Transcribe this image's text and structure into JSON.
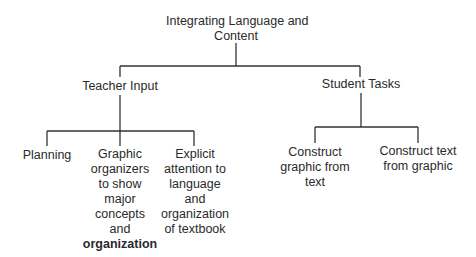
{
  "diagram": {
    "type": "tree",
    "root": {
      "label_lines": [
        "Integrating Language and",
        "Content"
      ]
    },
    "branches": [
      {
        "label": "Teacher Input",
        "children": [
          {
            "label_lines": [
              "Planning"
            ]
          },
          {
            "label_lines": [
              "Graphic",
              "organizers",
              "to show",
              "major",
              "concepts",
              "and",
              "organization"
            ]
          },
          {
            "label_lines": [
              "Explicit",
              "attention to",
              "language",
              "and",
              "organization",
              "of textbook"
            ]
          }
        ]
      },
      {
        "label": "Student Tasks",
        "children": [
          {
            "label_lines": [
              "Construct",
              "graphic from",
              "text"
            ]
          },
          {
            "label_lines": [
              "Construct text",
              "from graphic"
            ]
          }
        ]
      }
    ],
    "line_color": "#333333",
    "text_color": "#2a2a2a"
  }
}
